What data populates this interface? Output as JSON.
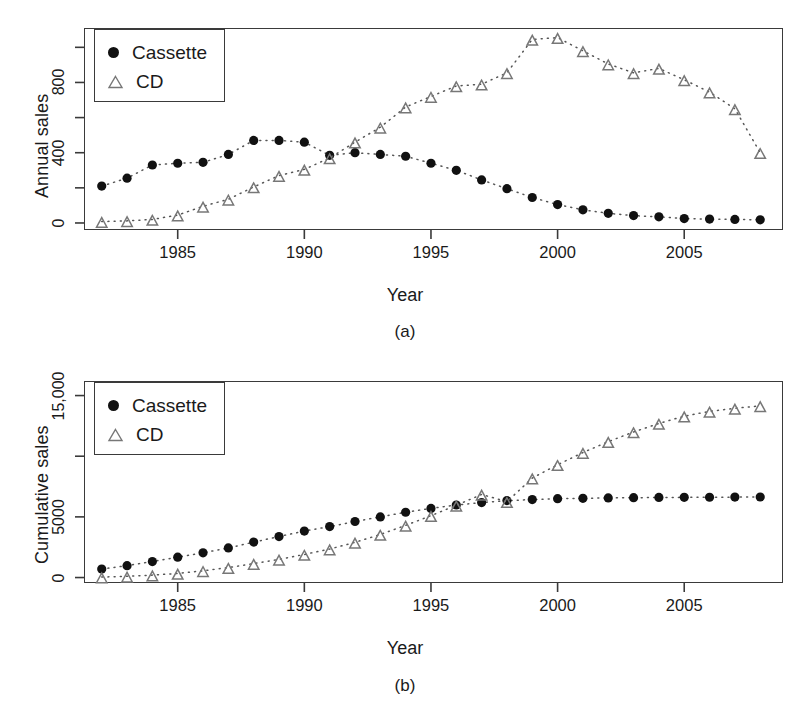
{
  "figure": {
    "panel_a_tag": "(a)",
    "panel_b_tag": "(b)"
  },
  "legend": {
    "cassette_label": "Cassette",
    "cd_label": "CD"
  },
  "chart_data": [
    {
      "type": "scatter",
      "panel": "(a)",
      "title": "",
      "xlabel": "Year",
      "ylabel": "Annual sales",
      "xlim": [
        1981.3,
        2008.9
      ],
      "ylim": [
        -40,
        1110
      ],
      "grid": false,
      "legend_position": "top-left",
      "xticks": [
        1985,
        1990,
        1995,
        2000,
        2005
      ],
      "xtick_labels": [
        "1985",
        "1990",
        "1995",
        "2000",
        "2005"
      ],
      "yticks": [
        0,
        200,
        400,
        600,
        800,
        1000
      ],
      "ytick_labels": [
        "0",
        "",
        "400",
        "",
        "800",
        ""
      ],
      "x": [
        1982,
        1983,
        1984,
        1985,
        1986,
        1987,
        1988,
        1989,
        1990,
        1991,
        1992,
        1993,
        1994,
        1995,
        1996,
        1997,
        1998,
        1999,
        2000,
        2001,
        2002,
        2003,
        2004,
        2005,
        2006,
        2007,
        2008
      ],
      "series": [
        {
          "name": "Cassette",
          "marker": "filled-circle",
          "values": [
            210,
            255,
            330,
            340,
            345,
            390,
            470,
            470,
            460,
            385,
            400,
            390,
            380,
            340,
            300,
            245,
            195,
            145,
            105,
            75,
            55,
            42,
            35,
            25,
            22,
            20,
            18
          ]
        },
        {
          "name": "CD",
          "marker": "open-triangle",
          "values": [
            8,
            12,
            20,
            45,
            95,
            135,
            205,
            270,
            305,
            370,
            460,
            545,
            660,
            720,
            780,
            790,
            855,
            1045,
            1055,
            980,
            905,
            855,
            880,
            815,
            745,
            650,
            400
          ]
        }
      ]
    },
    {
      "type": "scatter",
      "panel": "(b)",
      "title": "",
      "xlabel": "Year",
      "ylabel": "Cumulative sales",
      "xlim": [
        1981.3,
        2008.9
      ],
      "ylim": [
        -450,
        16200
      ],
      "grid": false,
      "legend_position": "top-left",
      "xticks": [
        1985,
        1990,
        1995,
        2000,
        2005
      ],
      "xtick_labels": [
        "1985",
        "1990",
        "1995",
        "2000",
        "2005"
      ],
      "yticks": [
        0,
        5000,
        10000,
        15000
      ],
      "ytick_labels": [
        "0",
        "5000",
        "",
        "15,000"
      ],
      "x": [
        1982,
        1983,
        1984,
        1985,
        1986,
        1987,
        1988,
        1989,
        1990,
        1991,
        1992,
        1993,
        1994,
        1995,
        1996,
        1997,
        1998,
        1999,
        2000,
        2001,
        2002,
        2003,
        2004,
        2005,
        2006,
        2007,
        2008
      ],
      "series": [
        {
          "name": "Cassette",
          "marker": "filled-circle",
          "values": [
            700,
            980,
            1320,
            1680,
            2040,
            2440,
            2920,
            3380,
            3830,
            4200,
            4620,
            5000,
            5380,
            5700,
            5980,
            6180,
            6340,
            6430,
            6500,
            6530,
            6560,
            6580,
            6600,
            6610,
            6620,
            6630,
            6640
          ]
        },
        {
          "name": "CD",
          "marker": "open-triangle",
          "values": [
            40,
            100,
            200,
            340,
            560,
            820,
            1150,
            1500,
            1900,
            2350,
            2900,
            3550,
            4300,
            5100,
            5950,
            6850,
            6250,
            8200,
            9300,
            10300,
            11200,
            12000,
            12700,
            13300,
            13700,
            13950,
            14150
          ]
        }
      ]
    }
  ]
}
